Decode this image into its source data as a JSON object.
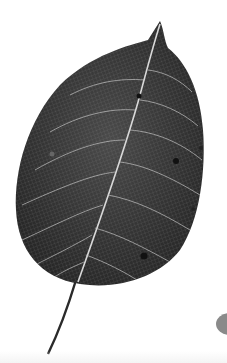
{
  "image": {
    "subject": "Skeletonized leaf with dark lamina and light vein network",
    "background_color": "#ffffff",
    "leaf_color": "#3a3a3a",
    "vein_color": "#d8d8d8",
    "edge_object_color": "#8a8a8a"
  }
}
